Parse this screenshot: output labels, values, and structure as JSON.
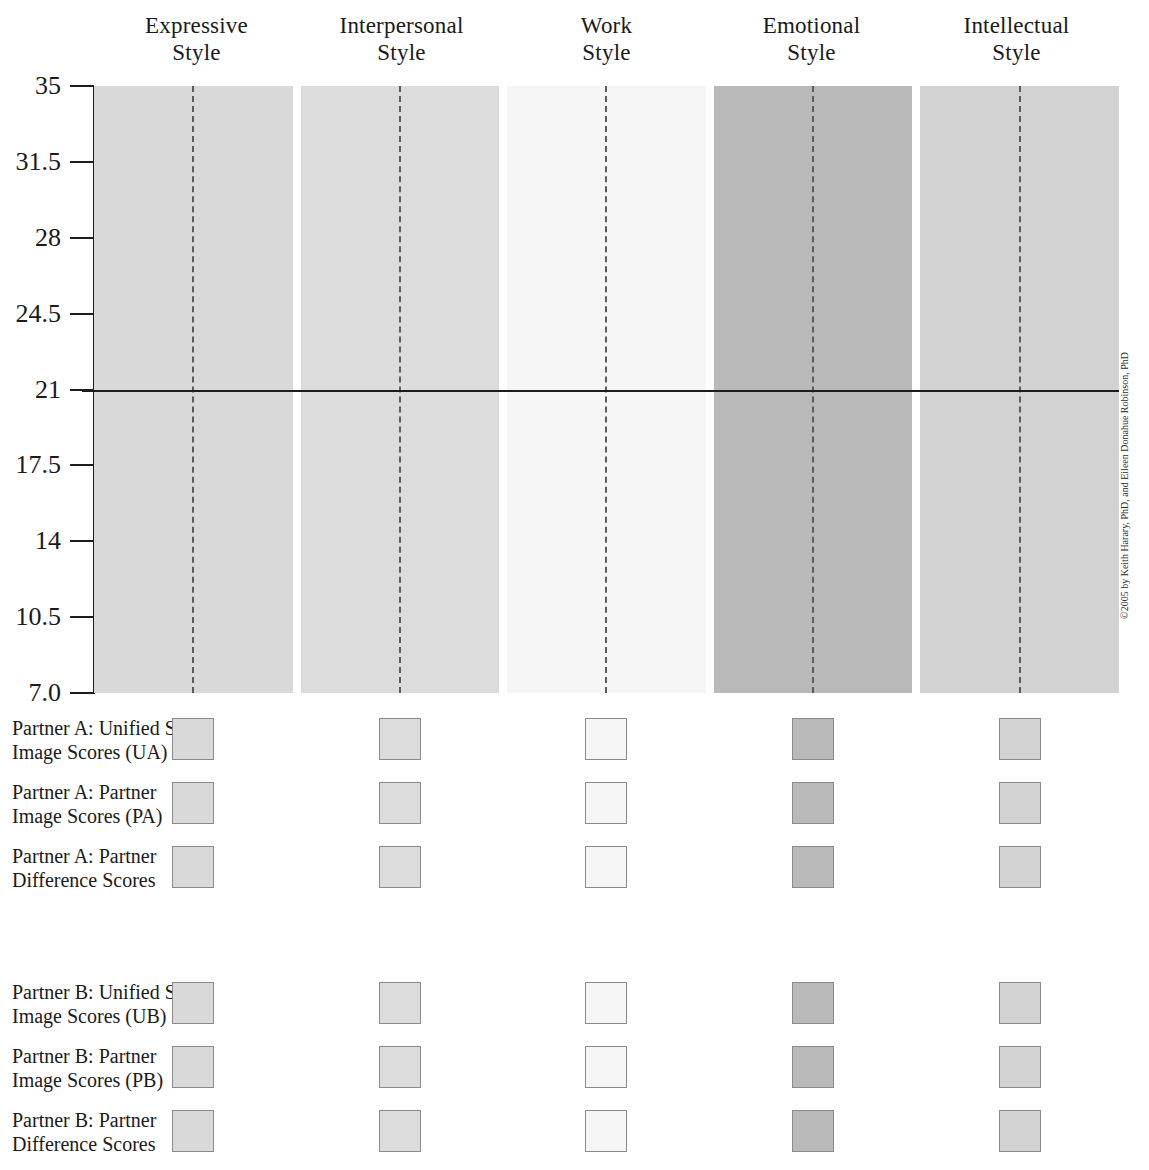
{
  "chart_data": {
    "type": "bar",
    "title": "",
    "subtitle": "",
    "xlabel": "",
    "ylabel": "",
    "categories": [
      "Expressive Style",
      "Interpersonal Style",
      "Work Style",
      "Emotional Style",
      "Intellectual Style"
    ],
    "category_lines": [
      [
        "Expressive",
        "Style"
      ],
      [
        "Interpersonal",
        "Style"
      ],
      [
        "Work",
        "Style"
      ],
      [
        "Emotional",
        "Style"
      ],
      [
        "Intellectual",
        "Style"
      ]
    ],
    "ylim": [
      7.0,
      35
    ],
    "ytick_labels": [
      "35",
      "31.5",
      "28",
      "24.5",
      "21",
      "17.5",
      "14",
      "10.5",
      "7.0"
    ],
    "ytick_values": [
      35,
      31.5,
      28,
      24.5,
      21,
      17.5,
      14,
      10.5,
      7.0
    ],
    "grid": false,
    "legend_position": "bottom-left",
    "midline_value": 21,
    "column_shades": [
      "#d9d9d9",
      "#dcdcdc",
      "#f5f5f5",
      "#b9b9b9",
      "#d2d2d2"
    ],
    "column_has_center_dashed_line": true,
    "annotations": [
      "Solid horizontal reference line drawn at score 21 across all five style columns",
      "Each style column contains a vertical dashed centre line"
    ],
    "series": [
      {
        "name": "Partner A: Unified Self-Image Scores (UA)",
        "values": [
          null,
          null,
          null,
          null,
          null
        ]
      },
      {
        "name": "Partner A: Partner Image Scores (PA)",
        "values": [
          null,
          null,
          null,
          null,
          null
        ]
      },
      {
        "name": "Partner A: Partner Difference Scores",
        "values": [
          null,
          null,
          null,
          null,
          null
        ]
      },
      {
        "name": "Partner B: Unified Self-Image Scores (UB)",
        "values": [
          null,
          null,
          null,
          null,
          null
        ]
      },
      {
        "name": "Partner B: Partner Image Scores (PB)",
        "values": [
          null,
          null,
          null,
          null,
          null
        ]
      },
      {
        "name": "Partner B: Partner Difference Scores",
        "values": [
          null,
          null,
          null,
          null,
          null
        ]
      }
    ]
  },
  "axis": {
    "ticks": [
      {
        "label": "35",
        "value": 35
      },
      {
        "label": "31.5",
        "value": 31.5
      },
      {
        "label": "28",
        "value": 28
      },
      {
        "label": "24.5",
        "value": 24.5
      },
      {
        "label": "21",
        "value": 21
      },
      {
        "label": "17.5",
        "value": 17.5
      },
      {
        "label": "14",
        "value": 14
      },
      {
        "label": "10.5",
        "value": 10.5
      },
      {
        "label": "7.0",
        "value": 7.0
      }
    ]
  },
  "headers": [
    {
      "line1": "Expressive",
      "line2": "Style"
    },
    {
      "line1": "Interpersonal",
      "line2": "Style"
    },
    {
      "line1": "Work",
      "line2": "Style"
    },
    {
      "line1": "Emotional",
      "line2": "Style"
    },
    {
      "line1": "Intellectual",
      "line2": "Style"
    }
  ],
  "legend": {
    "group_a": [
      {
        "line1": "Partner A: Unified Self-",
        "line2": "Image Scores (UA)"
      },
      {
        "line1": "Partner A: Partner",
        "line2": "Image Scores (PA)"
      },
      {
        "line1": "Partner A: Partner",
        "line2": "Difference Scores"
      }
    ],
    "group_b": [
      {
        "line1": "Partner B: Unified Self-",
        "line2": "Image Scores (UB)"
      },
      {
        "line1": "Partner B: Partner",
        "line2": "Image Scores (PB)"
      },
      {
        "line1": "Partner B: Partner",
        "line2": "Difference Scores"
      }
    ]
  },
  "copyright": "©2005 by Keith Harary, PhD, and Eileen Donahue Robinson, PhD"
}
